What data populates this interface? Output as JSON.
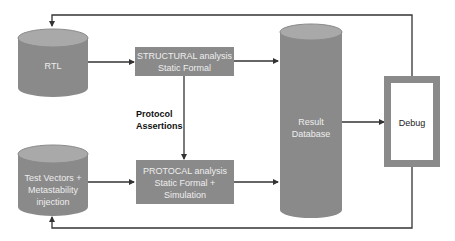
{
  "diagram": {
    "type": "flow",
    "colors": {
      "node_fill": "#8a8a8a",
      "node_top": "#a9a9a9",
      "edge": "#333333",
      "debug_frame": "#8a8a8a",
      "debug_inner": "#ffffff"
    },
    "nodes": {
      "rtl": {
        "shape": "cylinder",
        "lines": [
          "RTL"
        ]
      },
      "test_vectors": {
        "shape": "cylinder",
        "lines": [
          "Test Vectors +",
          "Metastability",
          "injection"
        ]
      },
      "structural": {
        "shape": "box",
        "lines": [
          "STRUCTURAL analysis",
          "Static Formal"
        ]
      },
      "protocol": {
        "shape": "box",
        "lines": [
          "PROTOCAL analysis",
          "Static Formal +",
          "Simulation"
        ]
      },
      "result_db": {
        "shape": "cylinder",
        "lines": [
          "Result",
          "Database"
        ]
      },
      "debug": {
        "shape": "framed-box",
        "lines": [
          "Debug"
        ]
      }
    },
    "edge_label": {
      "lines": [
        "Protocol",
        "Assertions"
      ]
    },
    "edges": [
      {
        "from": "rtl",
        "to": "structural"
      },
      {
        "from": "structural",
        "to": "protocol",
        "label": "Protocol Assertions"
      },
      {
        "from": "test_vectors",
        "to": "protocol"
      },
      {
        "from": "structural",
        "to": "result_db"
      },
      {
        "from": "protocol",
        "to": "result_db"
      },
      {
        "from": "result_db",
        "to": "debug"
      },
      {
        "from": "debug",
        "to": "rtl"
      },
      {
        "from": "debug",
        "to": "test_vectors"
      }
    ]
  }
}
